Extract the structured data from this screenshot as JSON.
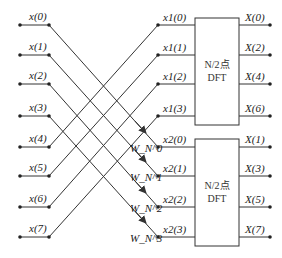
{
  "inputs": [
    "x(0)",
    "x(1)",
    "x(2)",
    "x(3)",
    "x(4)",
    "x(5)",
    "x(6)",
    "x(7)"
  ],
  "upper": {
    "inputs": [
      "x1(0)",
      "x1(1)",
      "x1(2)",
      "x1(3)"
    ],
    "block_line1": "N/2点",
    "block_line2": "DFT",
    "outputs": [
      "X(0)",
      "X(2)",
      "X(4)",
      "X(6)"
    ]
  },
  "lower": {
    "inputs": [
      "x2(0)",
      "x2(1)",
      "x2(2)",
      "x2(3)"
    ],
    "block_line1": "N/2点",
    "block_line2": "DFT",
    "outputs": [
      "X(1)",
      "X(3)",
      "X(5)",
      "X(7)"
    ]
  },
  "twiddles": [
    "W_N^0",
    "W_N^1",
    "W_N^2",
    "W_N^3"
  ],
  "colors": {
    "line": "#333333",
    "background": "#ffffff"
  }
}
